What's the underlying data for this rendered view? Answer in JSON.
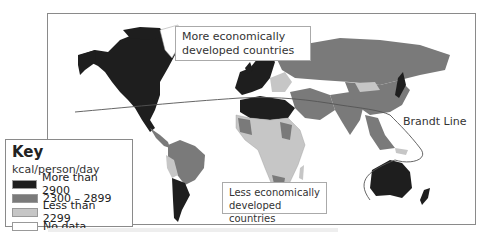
{
  "map": {
    "title": "Food consumption (kcal/person/day) and the Brandt Line",
    "labels": {
      "north": "More economically developed countries",
      "north_line1": "More economically",
      "north_line2": "developed countries",
      "south_line1": "Less economically",
      "south_line2": "developed countries",
      "brandt": "Brandt Line"
    }
  },
  "key": {
    "title": "Key",
    "unit": "kcal/person/day",
    "items": [
      {
        "label": "More than 2900",
        "color": "#1e1e1e"
      },
      {
        "label": "2300 – 2899",
        "color": "#7a7a7a"
      },
      {
        "label": "Less than 2299",
        "color": "#c6c6c6"
      },
      {
        "label": "No data",
        "color": "#ffffff"
      }
    ]
  },
  "colors": {
    "high": "#1e1e1e",
    "mid": "#7a7a7a",
    "low": "#c6c6c6",
    "none": "#ffffff",
    "border": "#8a8a8a"
  }
}
